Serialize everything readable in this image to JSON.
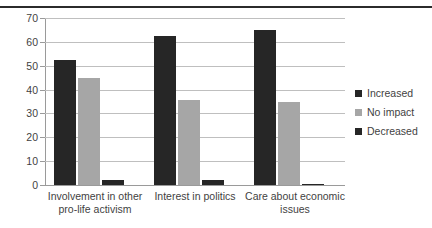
{
  "chart_data": {
    "type": "bar",
    "title": "",
    "subtitle": "",
    "xlabel": "",
    "ylabel": "",
    "ylim": [
      0,
      70
    ],
    "ytick_step": 10,
    "yticks": [
      0,
      10,
      20,
      30,
      40,
      50,
      60,
      70
    ],
    "ytick_labels": [
      "0",
      "10",
      "20",
      "30",
      "40",
      "50",
      "60",
      "70"
    ],
    "grid": true,
    "grid_axis": "y",
    "legend_position": "right",
    "categories": [
      "Involvement in other pro-life activism",
      "Interest in politics",
      "Care about economic issues"
    ],
    "category_lines": [
      [
        "Involvement in other",
        "pro-life activism"
      ],
      [
        "Interest in politics",
        ""
      ],
      [
        "Care about economic",
        "issues"
      ]
    ],
    "series": [
      {
        "name": "Increased",
        "color": "#262626",
        "values": [
          52.5,
          62.5,
          65
        ]
      },
      {
        "name": "No impact",
        "color": "#a6a6a6",
        "values": [
          45,
          35.5,
          35
        ]
      },
      {
        "name": "Decreased",
        "color": "#262626",
        "values": [
          2.2,
          2,
          0.3
        ]
      }
    ]
  },
  "legend": {
    "items": [
      {
        "label": "Increased",
        "color": "#262626"
      },
      {
        "label": "No impact",
        "color": "#a6a6a6"
      },
      {
        "label": "Decreased",
        "color": "#262626"
      }
    ]
  },
  "colors": {
    "increased": "#262626",
    "no_impact": "#a6a6a6",
    "decreased": "#262626",
    "gridline": "#bfbfbf",
    "axis": "#9a9a9a",
    "text": "#3f3f3f",
    "rule": "#2b2b2b",
    "background": "#ffffff"
  }
}
